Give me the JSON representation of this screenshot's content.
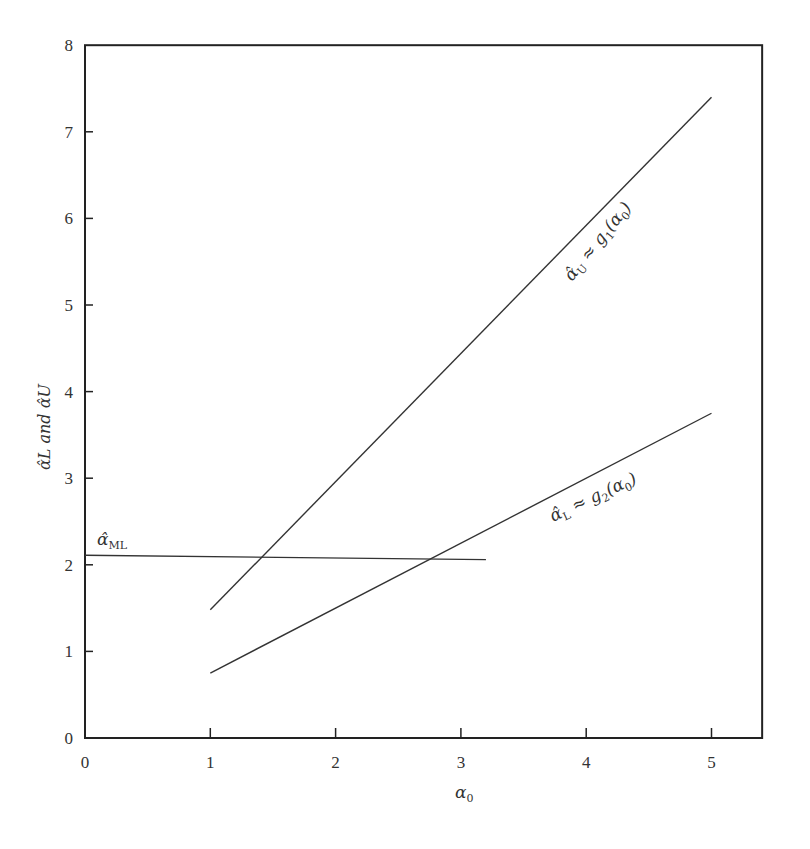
{
  "chart_data": {
    "type": "line",
    "title": "",
    "xlabel": "α0",
    "ylabel": "α̂L and α̂U",
    "xlim": [
      0,
      5.5
    ],
    "ylim": [
      0,
      8
    ],
    "x_ticks": [
      "0",
      "1",
      "2",
      "3",
      "4",
      "5"
    ],
    "y_ticks": [
      "0",
      "1",
      "2",
      "3",
      "4",
      "5",
      "6",
      "7",
      "8"
    ],
    "grid": false,
    "legend": null,
    "series": [
      {
        "name": "α̂U ≈ g1(α0)",
        "x": [
          1,
          5
        ],
        "y": [
          1.48,
          7.4
        ]
      },
      {
        "name": "α̂L ≈ g2(α0)",
        "x": [
          1,
          5
        ],
        "y": [
          0.75,
          3.75
        ]
      },
      {
        "name": "α̂ML",
        "x": [
          0,
          3.2
        ],
        "y": [
          2.11,
          2.06
        ]
      }
    ],
    "annotations": [
      {
        "text": "α̂U ≈ g1(α0)",
        "near": "upper line",
        "rotated": true
      },
      {
        "text": "α̂L ≈ g2(α0)",
        "near": "lower line",
        "rotated": true
      },
      {
        "text": "α̂ML",
        "near": "horizontal line, left"
      }
    ]
  },
  "labels": {
    "xlabel_main": "α",
    "xlabel_sub": "0",
    "ylabel_text": "α̂L and α̂U",
    "upper_main": "α̂",
    "upper_sub": "U",
    "upper_rest": " ≈ g",
    "upper_rest_sub": "1",
    "upper_paren": "(α",
    "upper_paren_sub": "0",
    "upper_close": ")",
    "lower_main": "α̂",
    "lower_sub": "L",
    "lower_rest": " ≈ g",
    "lower_rest_sub": "2",
    "lower_paren": "(α",
    "lower_paren_sub": "0",
    "lower_close": ")",
    "ml_main": "α̂",
    "ml_sub": "ML"
  }
}
